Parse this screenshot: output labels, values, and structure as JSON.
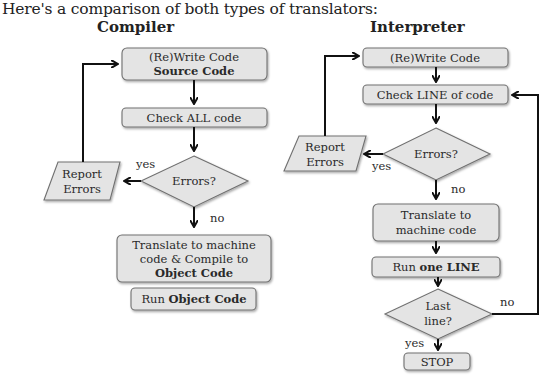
{
  "intro_text": "Here's a comparison of both types of translators:",
  "compiler": {
    "title": "Compiler",
    "rewrite_line1": "(Re)Write Code",
    "rewrite_line2": "Source Code",
    "check": "Check ALL code",
    "decision": "Errors?",
    "yes_label": "yes",
    "no_label": "no",
    "report_line1": "Report",
    "report_line2": "Errors",
    "translate_line1": "Translate to machine",
    "translate_line2": "code & Compile to",
    "translate_line3": "Object Code",
    "run_prefix": "Run ",
    "run_bold": "Object Code"
  },
  "interpreter": {
    "title": "Interpreter",
    "rewrite": "(Re)Write Code",
    "check": "Check LINE of code",
    "decision": "Errors?",
    "yes_label": "yes",
    "no_label": "no",
    "report_line1": "Report",
    "report_line2": "Errors",
    "translate_line1": "Translate to",
    "translate_line2": "machine code",
    "run_prefix": "Run ",
    "run_bold": "one LINE",
    "last_line1": "Last",
    "last_line2": "line?",
    "last_no": "no",
    "last_yes": "yes",
    "stop": "STOP"
  },
  "colors": {
    "shape_fill": "#e4e4e4",
    "shape_stroke": "#707070",
    "arrow": "#111111"
  }
}
